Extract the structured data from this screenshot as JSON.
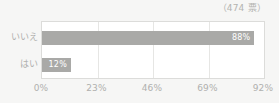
{
  "widget": {
    "name": "poll-result-bar-chart",
    "votes_caption": "（474 票）"
  },
  "colors": {
    "bar": "#a9a9a7",
    "plot_background": "#ffffff",
    "page_background": "#f6f6f5",
    "gridline": "#e6e6e4",
    "frame": "#dcdcda",
    "label_text": "#b0b0ae",
    "value_text": "#ffffff"
  },
  "chart_data": {
    "type": "bar",
    "orientation": "horizontal",
    "title": "",
    "subtitle": "（474 票）",
    "xlabel": "",
    "ylabel": "",
    "categories": [
      "いいえ",
      "はい"
    ],
    "values": [
      88,
      12
    ],
    "value_labels": [
      "88%",
      "12%"
    ],
    "xlim": [
      0,
      92
    ],
    "xticks": [
      0,
      23,
      46,
      69,
      92
    ],
    "xtick_labels": [
      "0%",
      "23%",
      "46%",
      "69%",
      "92%"
    ],
    "grid": true,
    "legend": false,
    "total_votes": 474,
    "series": [
      {
        "name": "回答割合",
        "values": [
          88,
          12
        ]
      }
    ]
  }
}
